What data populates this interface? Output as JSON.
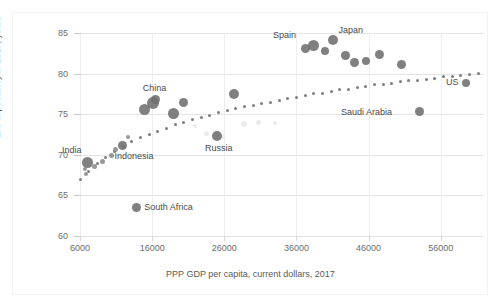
{
  "chart_data": {
    "type": "scatter",
    "title": "",
    "xlabel": "PPP GDP per capita, current dollars, 2017",
    "ylabel": "Life expectancy in 2017, years",
    "xlim": [
      6000,
      62000
    ],
    "ylim": [
      60,
      85
    ],
    "x_ticks": [
      6000,
      16000,
      26000,
      36000,
      46000,
      56000
    ],
    "y_ticks": [
      60,
      65,
      70,
      75,
      80,
      85
    ],
    "grid": true,
    "legend": "none",
    "marker_color": "#6e6e6e",
    "trendline": {
      "style": "dotted",
      "color": "#7d7d7d",
      "shape": "logarithmic"
    },
    "labeled_points": [
      {
        "label": "India",
        "x": 7100,
        "y": 69.0,
        "size": 11
      },
      {
        "label": "Indonesia",
        "x": 11900,
        "y": 71.2,
        "size": 9
      },
      {
        "label": "China",
        "x": 16100,
        "y": 76.4,
        "size": 12
      },
      {
        "label": "Russia",
        "x": 25000,
        "y": 72.3,
        "size": 10
      },
      {
        "label": "South Africa",
        "x": 13800,
        "y": 63.5,
        "size": 9
      },
      {
        "label": "Spain",
        "x": 38300,
        "y": 83.4,
        "size": 11
      },
      {
        "label": "Japan",
        "x": 41000,
        "y": 84.1,
        "size": 10
      },
      {
        "label": "Saudi Arabia",
        "x": 53000,
        "y": 75.3,
        "size": 9
      },
      {
        "label": "US",
        "x": 59500,
        "y": 78.9,
        "size": 8
      }
    ],
    "unlabeled_points": [
      {
        "x": 14900,
        "y": 75.6,
        "size": 11
      },
      {
        "x": 16400,
        "y": 76.8,
        "size": 9
      },
      {
        "x": 19000,
        "y": 75.1,
        "size": 11
      },
      {
        "x": 20300,
        "y": 76.5,
        "size": 9
      },
      {
        "x": 27300,
        "y": 77.5,
        "size": 10
      },
      {
        "x": 37300,
        "y": 83.1,
        "size": 9
      },
      {
        "x": 39900,
        "y": 82.8,
        "size": 8
      },
      {
        "x": 42800,
        "y": 82.2,
        "size": 9
      },
      {
        "x": 44100,
        "y": 81.4,
        "size": 9
      },
      {
        "x": 45600,
        "y": 81.6,
        "size": 8
      },
      {
        "x": 47500,
        "y": 82.3,
        "size": 9
      },
      {
        "x": 50600,
        "y": 81.1,
        "size": 9
      }
    ],
    "trend_points": [
      {
        "x": 6000,
        "y": 66.9
      },
      {
        "x": 7200,
        "y": 68.0
      },
      {
        "x": 8400,
        "y": 68.9
      },
      {
        "x": 9600,
        "y": 69.7
      },
      {
        "x": 10800,
        "y": 70.4
      },
      {
        "x": 12000,
        "y": 71.0
      },
      {
        "x": 13200,
        "y": 71.6
      },
      {
        "x": 14400,
        "y": 72.1
      },
      {
        "x": 15600,
        "y": 72.5
      },
      {
        "x": 16800,
        "y": 72.9
      },
      {
        "x": 18000,
        "y": 73.3
      },
      {
        "x": 19200,
        "y": 73.7
      },
      {
        "x": 20400,
        "y": 74.0
      },
      {
        "x": 21600,
        "y": 74.3
      },
      {
        "x": 22800,
        "y": 74.6
      },
      {
        "x": 24000,
        "y": 74.9
      },
      {
        "x": 25200,
        "y": 75.2
      },
      {
        "x": 26400,
        "y": 75.4
      },
      {
        "x": 27600,
        "y": 75.7
      },
      {
        "x": 28800,
        "y": 75.9
      },
      {
        "x": 30000,
        "y": 76.1
      },
      {
        "x": 31200,
        "y": 76.3
      },
      {
        "x": 32400,
        "y": 76.5
      },
      {
        "x": 33600,
        "y": 76.7
      },
      {
        "x": 34800,
        "y": 76.9
      },
      {
        "x": 36000,
        "y": 77.1
      },
      {
        "x": 37200,
        "y": 77.3
      },
      {
        "x": 38400,
        "y": 77.5
      },
      {
        "x": 39600,
        "y": 77.6
      },
      {
        "x": 40800,
        "y": 77.8
      },
      {
        "x": 42000,
        "y": 78.0
      },
      {
        "x": 43200,
        "y": 78.1
      },
      {
        "x": 44400,
        "y": 78.3
      },
      {
        "x": 45600,
        "y": 78.4
      },
      {
        "x": 46800,
        "y": 78.6
      },
      {
        "x": 48000,
        "y": 78.7
      },
      {
        "x": 49200,
        "y": 78.8
      },
      {
        "x": 50400,
        "y": 79.0
      },
      {
        "x": 51600,
        "y": 79.1
      },
      {
        "x": 52800,
        "y": 79.2
      },
      {
        "x": 54000,
        "y": 79.3
      },
      {
        "x": 55200,
        "y": 79.4
      },
      {
        "x": 56400,
        "y": 79.6
      },
      {
        "x": 57600,
        "y": 79.7
      },
      {
        "x": 58800,
        "y": 79.8
      },
      {
        "x": 60000,
        "y": 79.9
      },
      {
        "x": 61200,
        "y": 80.0
      }
    ],
    "watermark_points": [
      {
        "x": 28800,
        "y": 73.8,
        "size": 6
      },
      {
        "x": 30800,
        "y": 74.0,
        "size": 5
      },
      {
        "x": 33000,
        "y": 73.9,
        "size": 4
      },
      {
        "x": 23500,
        "y": 72.6,
        "size": 5
      },
      {
        "x": 25800,
        "y": 72.2,
        "size": 4
      },
      {
        "x": 22000,
        "y": 73.6,
        "size": 4
      }
    ],
    "tiny_points": [
      {
        "x": 6700,
        "y": 68.2,
        "size": 4
      },
      {
        "x": 6900,
        "y": 67.6,
        "size": 4
      },
      {
        "x": 8000,
        "y": 68.6,
        "size": 5
      },
      {
        "x": 9100,
        "y": 69.2,
        "size": 5
      },
      {
        "x": 10300,
        "y": 69.9,
        "size": 5
      },
      {
        "x": 10900,
        "y": 70.6,
        "size": 5
      },
      {
        "x": 12700,
        "y": 72.2,
        "size": 4
      }
    ]
  }
}
